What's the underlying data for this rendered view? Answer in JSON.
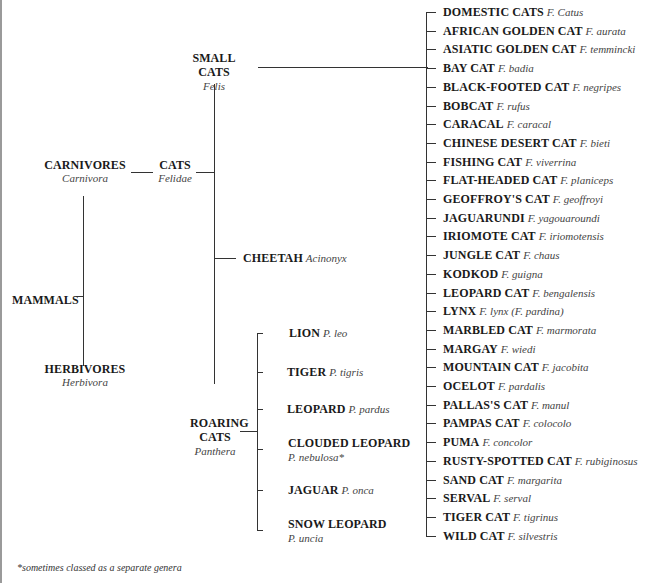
{
  "diagram": {
    "type": "taxonomy-tree",
    "root": {
      "name": "MAMMALS"
    },
    "carnivores": {
      "name": "CARNIVORES",
      "latin": "Carnivora"
    },
    "herbivores": {
      "name": "HERBIVORES",
      "latin": "Herbivora"
    },
    "cats": {
      "name": "CATS",
      "latin": "Felidae"
    },
    "small_cats": {
      "name": "SMALL CATS",
      "latin": "Felis"
    },
    "cheetah": {
      "name": "CHEETAH",
      "latin": "Acinonyx"
    },
    "roaring_cats": {
      "name_line1": "ROARING",
      "name_line2": "CATS",
      "latin": "Panthera"
    },
    "roaring_species": [
      {
        "name": "LION",
        "latin": "P. leo"
      },
      {
        "name": "TIGER",
        "latin": "P. tigris"
      },
      {
        "name": "LEOPARD",
        "latin": "P. pardus"
      },
      {
        "name": "CLOUDED LEOPARD",
        "latin": "P. nebulosa*"
      },
      {
        "name": "JAGUAR",
        "latin": "P. onca"
      },
      {
        "name": "SNOW LEOPARD",
        "latin": "P. uncia"
      }
    ],
    "small_species": [
      {
        "name": "DOMESTIC CATS",
        "latin": "F. Catus"
      },
      {
        "name": "AFRICAN GOLDEN CAT",
        "latin": "F. aurata"
      },
      {
        "name": "ASIATIC GOLDEN CAT",
        "latin": "F. temmincki"
      },
      {
        "name": "BAY CAT",
        "latin": "F. badia"
      },
      {
        "name": "BLACK-FOOTED CAT",
        "latin": "F. negripes"
      },
      {
        "name": "BOBCAT",
        "latin": "F. rufus"
      },
      {
        "name": "CARACAL",
        "latin": "F. caracal"
      },
      {
        "name": "CHINESE DESERT CAT",
        "latin": "F. bieti"
      },
      {
        "name": "FISHING CAT",
        "latin": "F. viverrina"
      },
      {
        "name": "FLAT-HEADED CAT",
        "latin": "F. planiceps"
      },
      {
        "name": "GEOFFROY'S CAT",
        "latin": "F. geoffroyi"
      },
      {
        "name": "JAGUARUNDI",
        "latin": "F. yagouaroundi"
      },
      {
        "name": "IRIOMOTE CAT",
        "latin": "F. iriomotensis"
      },
      {
        "name": "JUNGLE CAT",
        "latin": "F. chaus"
      },
      {
        "name": "KODKOD",
        "latin": "F. guigna"
      },
      {
        "name": "LEOPARD CAT",
        "latin": "F. bengalensis"
      },
      {
        "name": "LYNX",
        "latin": "F. lynx (F. pardina)"
      },
      {
        "name": "MARBLED CAT",
        "latin": "F. marmorata"
      },
      {
        "name": "MARGAY",
        "latin": "F. wiedi"
      },
      {
        "name": "MOUNTAIN CAT",
        "latin": "F. jacobita"
      },
      {
        "name": "OCELOT",
        "latin": "F. pardalis"
      },
      {
        "name": "PALLAS'S CAT",
        "latin": "F. manul"
      },
      {
        "name": "PAMPAS CAT",
        "latin": "F. colocolo"
      },
      {
        "name": "PUMA",
        "latin": "F. concolor"
      },
      {
        "name": "RUSTY-SPOTTED CAT",
        "latin": "F. rubiginosus"
      },
      {
        "name": "SAND CAT",
        "latin": "F. margarita"
      },
      {
        "name": "SERVAL",
        "latin": "F. serval"
      },
      {
        "name": "TIGER CAT",
        "latin": "F. tigrinus"
      },
      {
        "name": "WILD CAT",
        "latin": "F. silvestris"
      }
    ],
    "footnote": "*sometimes classed as a separate genera"
  }
}
